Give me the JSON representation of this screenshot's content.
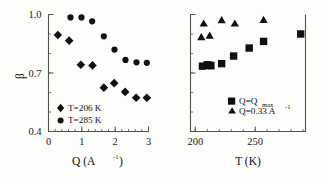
{
  "figure": {
    "background_color": "#fdfdfb",
    "marker_color": "#101010",
    "axis_color": "#55524e"
  },
  "chart_data": [
    {
      "type": "scatter",
      "panel": "left",
      "title": "",
      "xlabel": "Q  (A^-1)",
      "xlabel_base": "Q  (A",
      "xlabel_sup": "-1",
      "xlabel_tail": ")",
      "ylabel": "β",
      "xlim": [
        0,
        3
      ],
      "ylim": [
        0.4,
        1.0
      ],
      "xticks": [
        0,
        1,
        2,
        3
      ],
      "xticklabels": [
        "0",
        "1",
        "2",
        "3"
      ],
      "yticks": [
        0.4,
        0.7,
        1.0
      ],
      "yticklabels": [
        "0.4",
        "0.7",
        "1.0"
      ],
      "grid": false,
      "legend_position": "lower-left",
      "series": [
        {
          "name": "T=206 K",
          "marker": "diamond",
          "color": "#101010",
          "points": [
            {
              "x": 0.28,
              "y": 0.895
            },
            {
              "x": 0.62,
              "y": 0.866
            },
            {
              "x": 0.97,
              "y": 0.742
            },
            {
              "x": 1.32,
              "y": 0.739
            },
            {
              "x": 1.66,
              "y": 0.625
            },
            {
              "x": 1.97,
              "y": 0.648
            },
            {
              "x": 2.3,
              "y": 0.603
            },
            {
              "x": 2.63,
              "y": 0.573
            },
            {
              "x": 2.95,
              "y": 0.573
            }
          ]
        },
        {
          "name": "T=285 K",
          "marker": "circle",
          "color": "#101010",
          "points": [
            {
              "x": 0.66,
              "y": 0.985
            },
            {
              "x": 0.99,
              "y": 0.985
            },
            {
              "x": 1.31,
              "y": 0.965
            },
            {
              "x": 1.66,
              "y": 0.888
            },
            {
              "x": 1.98,
              "y": 0.82
            },
            {
              "x": 2.31,
              "y": 0.767
            },
            {
              "x": 2.64,
              "y": 0.755
            },
            {
              "x": 2.95,
              "y": 0.752
            }
          ]
        }
      ]
    },
    {
      "type": "scatter",
      "panel": "right",
      "title": "",
      "xlabel": "T (K)",
      "ylabel": "",
      "xlim": [
        196,
        292
      ],
      "ylim": [
        0.4,
        1.0
      ],
      "xticks": [
        200,
        250
      ],
      "xticklabels": [
        "200",
        "250"
      ],
      "yticks": [
        0.4,
        0.7,
        1.0
      ],
      "yticklabels": [],
      "grid": false,
      "legend_position": "lower-right",
      "series": [
        {
          "name": "Q=Q_max",
          "name_base": "Q=Q",
          "name_sub": "max",
          "marker": "square",
          "color": "#101010",
          "points": [
            {
              "x": 206,
              "y": 0.735
            },
            {
              "x": 210,
              "y": 0.742
            },
            {
              "x": 212,
              "y": 0.74
            },
            {
              "x": 213,
              "y": 0.737
            },
            {
              "x": 222,
              "y": 0.748
            },
            {
              "x": 232,
              "y": 0.787
            },
            {
              "x": 245,
              "y": 0.828
            },
            {
              "x": 257,
              "y": 0.862
            },
            {
              "x": 288,
              "y": 0.9
            }
          ]
        },
        {
          "name": "Q=0.33 A^-1",
          "name_base": "Q=0.33 A",
          "name_sup": "-1",
          "marker": "triangle",
          "color": "#101010",
          "points": [
            {
              "x": 205,
              "y": 0.885
            },
            {
              "x": 207,
              "y": 0.955
            },
            {
              "x": 212,
              "y": 0.893
            },
            {
              "x": 222,
              "y": 0.972
            },
            {
              "x": 233,
              "y": 0.955
            },
            {
              "x": 257,
              "y": 0.973
            }
          ]
        }
      ]
    }
  ]
}
